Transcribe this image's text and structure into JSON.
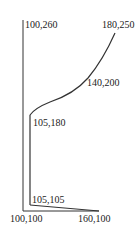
{
  "diagram": {
    "stroke_color": "#333333",
    "labels": {
      "p_100_260": "100,260",
      "p_180_250": "180,250",
      "p_140_200": "140,200",
      "p_105_180": "105,180",
      "p_105_105": "105,105",
      "p_100_100": "100,100",
      "p_160_100": "160,100"
    }
  }
}
